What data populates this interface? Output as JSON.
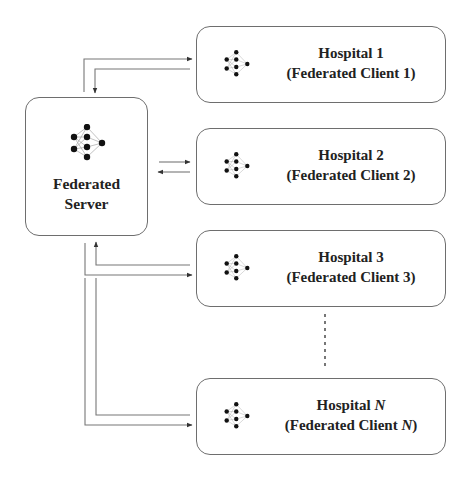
{
  "diagram": {
    "server": {
      "label_line1": "Federated",
      "label_line2": "Server",
      "icon": "neural-network-icon"
    },
    "clients": [
      {
        "name_prefix": "Hospital ",
        "index": "1",
        "sub_prefix": "(Federated Client ",
        "sub_index": "1",
        "sub_suffix": ")",
        "italic_index": false
      },
      {
        "name_prefix": "Hospital ",
        "index": "2",
        "sub_prefix": "(Federated Client ",
        "sub_index": "2",
        "sub_suffix": ")",
        "italic_index": false
      },
      {
        "name_prefix": "Hospital ",
        "index": "3",
        "sub_prefix": "(Federated Client ",
        "sub_index": "3",
        "sub_suffix": ")",
        "italic_index": false
      },
      {
        "name_prefix": "Hospital ",
        "index": "N",
        "sub_prefix": "(Federated Client ",
        "sub_index": "N",
        "sub_suffix": ")",
        "italic_index": true
      }
    ],
    "ellipsis": "vertical dotted line indicating more clients",
    "colors": {
      "stroke": "#6e6e6e",
      "text": "#222222",
      "node": "#111111",
      "background": "#ffffff"
    }
  }
}
